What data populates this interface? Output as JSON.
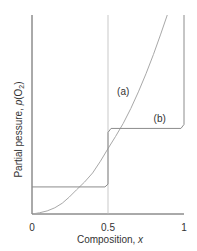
{
  "chart_data": {
    "type": "line",
    "title": "",
    "xlabel": "Composition, x",
    "ylabel_prefix": "Partial pessure, ",
    "ylabel_var": "p",
    "ylabel_paren_open": "(O",
    "ylabel_sub": "2",
    "ylabel_paren_close": ")",
    "xlim": [
      0,
      1
    ],
    "ylim": [
      0,
      1
    ],
    "xticks": [
      0,
      0.5,
      1
    ],
    "xtick_labels": [
      "0",
      "0.5",
      "1"
    ],
    "yticks": [],
    "grid": false,
    "reference_lines": [
      {
        "axis": "x",
        "value": 0.5
      }
    ],
    "series": [
      {
        "name": "(a)",
        "description": "smooth monotonic increasing curve",
        "x": [
          0,
          0.1,
          0.2,
          0.29,
          0.4,
          0.5,
          0.6,
          0.7,
          0.8,
          0.89
        ],
        "y": [
          0,
          0.0125,
          0.05,
          0.12,
          0.2,
          0.33,
          0.45,
          0.61,
          0.8,
          1.0
        ],
        "label_at": {
          "x": 0.6,
          "y": 0.6
        }
      },
      {
        "name": "(b)",
        "description": "stepped curve with plateaus",
        "x": [
          0,
          0.48,
          0.5,
          0.5,
          0.52,
          0.98,
          1.0,
          1.0
        ],
        "y": [
          0.136,
          0.136,
          0.15,
          0.41,
          0.43,
          0.43,
          0.45,
          1.0
        ],
        "label_at": {
          "x": 0.84,
          "y": 0.46
        }
      }
    ]
  }
}
